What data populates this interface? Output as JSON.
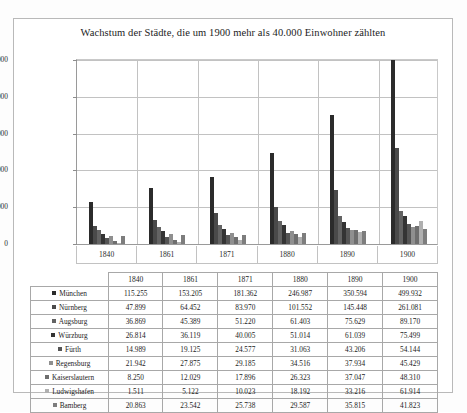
{
  "chart_data": {
    "type": "bar",
    "title": "Wachstum der Städte, die um 1900 mehr als 40.000 Einwohner zählten",
    "xlabel": "",
    "ylabel": "",
    "categories": [
      "1840",
      "1861",
      "1871",
      "1880",
      "1890",
      "1900"
    ],
    "ylim": [
      0,
      500000
    ],
    "yticks": [
      0,
      100000,
      200000,
      300000,
      400000,
      500000
    ],
    "ytick_labels": [
      "0",
      "100.000",
      "200.000",
      "300.000",
      "400.000",
      "500.000"
    ],
    "grid": true,
    "legend_position": "table-left",
    "series": [
      {
        "name": "München",
        "color": "#2b2b2b",
        "values": [
          115255,
          153205,
          181362,
          246987,
          350594,
          499932
        ]
      },
      {
        "name": "Nürnberg",
        "color": "#4a4a4a",
        "values": [
          47899,
          64452,
          83970,
          101552,
          145448,
          261081
        ]
      },
      {
        "name": "Augsburg",
        "color": "#636363",
        "values": [
          36869,
          45389,
          51220,
          61403,
          75629,
          89170
        ]
      },
      {
        "name": "Würzburg",
        "color": "#343434",
        "values": [
          26814,
          36119,
          40005,
          51014,
          61039,
          75499
        ]
      },
      {
        "name": "Fürth",
        "color": "#555555",
        "values": [
          14989,
          19125,
          24577,
          31063,
          43206,
          54144
        ]
      },
      {
        "name": "Regensburg",
        "color": "#8f8f8f",
        "values": [
          21942,
          27875,
          29185,
          34516,
          37934,
          45429
        ]
      },
      {
        "name": "Kaiserslautern",
        "color": "#6e6e6e",
        "values": [
          8250,
          12029,
          17896,
          26323,
          37047,
          48310
        ]
      },
      {
        "name": "Ludwigshafen",
        "color": "#b0b0b0",
        "values": [
          1511,
          5122,
          10023,
          18192,
          33216,
          61914
        ]
      },
      {
        "name": "Bamberg",
        "color": "#7d7d7d",
        "values": [
          20863,
          23542,
          25738,
          29587,
          35815,
          41823
        ]
      }
    ]
  },
  "table": {
    "corner_label": "",
    "year_headers": [
      "1840",
      "1861",
      "1871",
      "1880",
      "1890",
      "1900"
    ],
    "rows": [
      {
        "name": "München",
        "color": "#2b2b2b",
        "values": [
          "115.255",
          "153.205",
          "181.362",
          "246.987",
          "350.594",
          "499.932"
        ]
      },
      {
        "name": "Nürnberg",
        "color": "#4a4a4a",
        "values": [
          "47.899",
          "64.452",
          "83.970",
          "101.552",
          "145.448",
          "261.081"
        ]
      },
      {
        "name": "Augsburg",
        "color": "#636363",
        "values": [
          "36.869",
          "45.389",
          "51.220",
          "61.403",
          "75.629",
          "89.170"
        ]
      },
      {
        "name": "Würzburg",
        "color": "#343434",
        "values": [
          "26.814",
          "36.119",
          "40.005",
          "51.014",
          "61.039",
          "75.499"
        ]
      },
      {
        "name": "Fürth",
        "color": "#555555",
        "values": [
          "14.989",
          "19.125",
          "24.577",
          "31.063",
          "43.206",
          "54.144"
        ]
      },
      {
        "name": "Regensburg",
        "color": "#8f8f8f",
        "values": [
          "21.942",
          "27.875",
          "29.185",
          "34.516",
          "37.934",
          "45.429"
        ]
      },
      {
        "name": "Kaiserslautern",
        "color": "#6e6e6e",
        "values": [
          "8.250",
          "12.029",
          "17.896",
          "26.323",
          "37.047",
          "48.310"
        ]
      },
      {
        "name": "Ludwigshafen",
        "color": "#b0b0b0",
        "values": [
          "1.511",
          "5.122",
          "10.023",
          "18.192",
          "33.216",
          "61.914"
        ]
      },
      {
        "name": "Bamberg",
        "color": "#7d7d7d",
        "values": [
          "20.863",
          "23.542",
          "25.738",
          "29.587",
          "35.815",
          "41.823"
        ]
      }
    ]
  }
}
